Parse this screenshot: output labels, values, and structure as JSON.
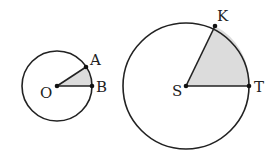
{
  "diagram": {
    "small_circle": {
      "center_label": "O",
      "point_labels": [
        "A",
        "B"
      ],
      "cx": 57,
      "cy": 86,
      "r": 35,
      "point_a": [
        86,
        67
      ],
      "point_b": [
        92,
        86
      ],
      "sector_fill": "#dcdcdc"
    },
    "large_circle": {
      "center_label": "S",
      "point_labels": [
        "K",
        "T"
      ],
      "cx": 186,
      "cy": 86,
      "r": 63,
      "point_k": [
        215,
        26
      ],
      "point_t": [
        249,
        86
      ],
      "sector_fill": "#dcdcdc"
    },
    "stroke_color": "#222222"
  }
}
